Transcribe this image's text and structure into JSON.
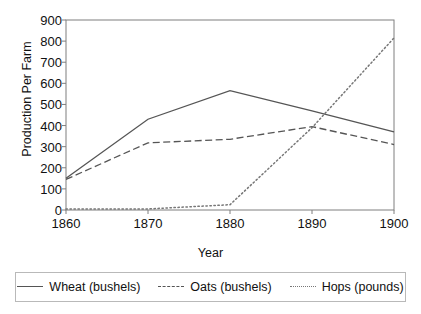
{
  "chart_data": {
    "type": "line",
    "title": "",
    "xlabel": "Year",
    "ylabel": "Production Per Farm",
    "categories": [
      "1860",
      "1870",
      "1880",
      "1890",
      "1900"
    ],
    "x": [
      1860,
      1870,
      1880,
      1890,
      1900
    ],
    "xlim": [
      1860,
      1900
    ],
    "ylim": [
      0,
      900
    ],
    "ytick_labels": [
      "900",
      "800",
      "700",
      "600",
      "500",
      "400",
      "300",
      "200",
      "100",
      "0"
    ],
    "ytick_values": [
      900,
      800,
      700,
      600,
      500,
      400,
      300,
      200,
      100,
      0
    ],
    "ytick_step": 100,
    "grid": false,
    "legend_position": "bottom",
    "series": [
      {
        "name": "Wheat (bushels)",
        "style": "solid",
        "color": "#555555",
        "values": [
          150,
          430,
          565,
          470,
          370
        ]
      },
      {
        "name": "Oats (bushels)",
        "style": "dashed",
        "color": "#555555",
        "values": [
          145,
          318,
          335,
          395,
          310
        ]
      },
      {
        "name": "Hops (pounds)",
        "style": "dotted",
        "color": "#777777",
        "values": [
          5,
          5,
          25,
          390,
          815
        ]
      }
    ]
  },
  "axes": {
    "y_title": "Production Per Farm",
    "x_title": "Year"
  },
  "legend": {
    "items": [
      {
        "label": "Wheat (bushels)",
        "style": "solid"
      },
      {
        "label": "Oats (bushels)",
        "style": "dashed"
      },
      {
        "label": "Hops (pounds)",
        "style": "dotted"
      }
    ]
  }
}
